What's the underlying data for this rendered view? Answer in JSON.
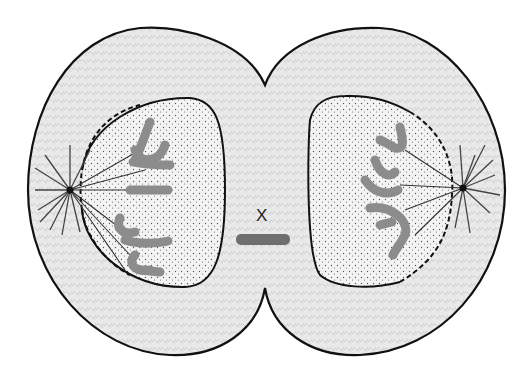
{
  "figure": {
    "label": "X",
    "colors": {
      "outline": "#111111",
      "cytoplasm": "#e6e6e6",
      "nucleus": "#f2f2f2",
      "chromosome": "#8c8c8c",
      "label_bar": "#6f6f6f",
      "background": "#ffffff"
    },
    "cells": [
      {
        "name": "left-daughter-cell",
        "chromosome_count": 6,
        "centrosome": "left"
      },
      {
        "name": "right-daughter-cell",
        "chromosome_count": 4,
        "centrosome": "right"
      }
    ],
    "elements": [
      "cell membrane",
      "cleavage furrow",
      "nuclear envelope (reforming)",
      "centrosomes with asters",
      "spindle fibers",
      "chromosomes",
      "lagging structure labeled X"
    ]
  }
}
